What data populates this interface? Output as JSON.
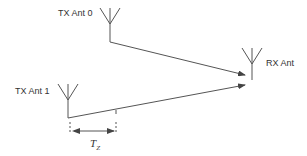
{
  "diagram": {
    "labels": {
      "tx0": "TX Ant 0",
      "tx1": "TX Ant 1",
      "rx": "RX Ant",
      "delay_main": "T",
      "delay_sub": "Z"
    },
    "colors": {
      "line": "#555555",
      "text": "#333333"
    }
  }
}
